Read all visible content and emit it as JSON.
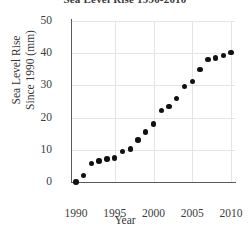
{
  "chart_data": {
    "type": "scatter",
    "title": "Sea Level Rise 1990-2010",
    "xlabel": "Year",
    "ylabel_line1": "Sea Level Rise",
    "ylabel_line2": "Since 1990 (mm)",
    "xlim": [
      1989.5,
      2010.5
    ],
    "ylim": [
      0,
      50
    ],
    "xticks": [
      "1990",
      "1995",
      "2000",
      "2005",
      "2010"
    ],
    "xtick_values": [
      1990,
      1995,
      2000,
      2005,
      2010
    ],
    "yticks": [
      "0",
      "10",
      "20",
      "30",
      "40",
      "50"
    ],
    "ytick_values": [
      0,
      10,
      20,
      30,
      40,
      50
    ],
    "grid": true,
    "legend": "none",
    "marker": "filled-circle",
    "marker_color": "#111111",
    "x": [
      1990,
      1991,
      1992,
      1993,
      1994,
      1995,
      1996,
      1997,
      1998,
      1999,
      2000,
      2001,
      2002,
      2003,
      2004,
      2005,
      2006,
      2007,
      2008,
      2009,
      2010
    ],
    "values": [
      0,
      2.0,
      5.8,
      6.5,
      7.2,
      7.5,
      9.5,
      10.3,
      13.0,
      15.5,
      18.0,
      22.3,
      23.5,
      26.0,
      29.7,
      31.3,
      35.0,
      38.0,
      38.5,
      39.3,
      40.3
    ]
  }
}
